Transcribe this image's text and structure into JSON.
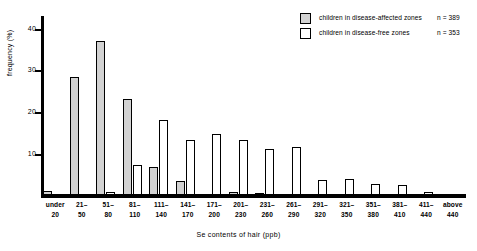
{
  "chart_data": {
    "type": "bar",
    "title": "",
    "xlabel": "Se contents of hair (ppb)",
    "ylabel": "frequency (%)",
    "ylim": [
      0,
      43
    ],
    "yticks": [
      10,
      20,
      30,
      40
    ],
    "grid": false,
    "legend_position": "top-right",
    "categories": [
      "under 20",
      "21–50",
      "51–80",
      "81–110",
      "111–140",
      "141–170",
      "171–200",
      "201–230",
      "231–260",
      "261–290",
      "291–320",
      "321–350",
      "351–380",
      "381–410",
      "411–440",
      "above 440"
    ],
    "category_lines": [
      [
        "under",
        "20"
      ],
      [
        "21–",
        "50"
      ],
      [
        "51–",
        "80"
      ],
      [
        "81–",
        "110"
      ],
      [
        "111–",
        "140"
      ],
      [
        "141–",
        "170"
      ],
      [
        "171–",
        "200"
      ],
      [
        "201–",
        "230"
      ],
      [
        "231–",
        "260"
      ],
      [
        "261–",
        "290"
      ],
      [
        "291–",
        "320"
      ],
      [
        "321–",
        "350"
      ],
      [
        "351–",
        "380"
      ],
      [
        "381–",
        "410"
      ],
      [
        "411–",
        "440"
      ],
      [
        "above",
        "440"
      ]
    ],
    "series": [
      {
        "name": "children in disease-affected zones",
        "n_label": "n = 389",
        "color": "#d2d2d2",
        "values": [
          1.2,
          28.5,
          37.0,
          23.2,
          7.0,
          3.5,
          0.0,
          1.0,
          0.8,
          0.0,
          0.0,
          0.0,
          0.0,
          0.0,
          0.0,
          0.0
        ]
      },
      {
        "name": "children in disease-free zones",
        "n_label": "n = 353",
        "color": "#ffffff",
        "values": [
          0.0,
          0.0,
          1.0,
          7.5,
          18.2,
          13.5,
          14.7,
          13.3,
          11.2,
          11.7,
          3.8,
          4.0,
          2.8,
          2.6,
          1.0,
          0.0
        ]
      }
    ]
  },
  "legend": {
    "rows": [
      {
        "label": "children in disease-affected zones",
        "n": "n = 389"
      },
      {
        "label": "children in disease-free zones",
        "n": "n = 353"
      }
    ]
  }
}
